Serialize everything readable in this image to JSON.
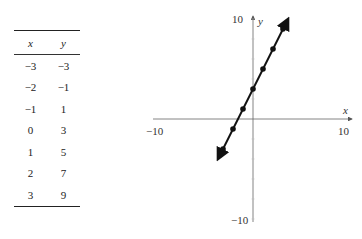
{
  "table": {
    "headers": {
      "x": "x",
      "y": "y"
    },
    "rows": [
      {
        "x": "−3",
        "y": "−3"
      },
      {
        "x": "−2",
        "y": "−1"
      },
      {
        "x": "−1",
        "y": "1"
      },
      {
        "x": "0",
        "y": "3"
      },
      {
        "x": "1",
        "y": "5"
      },
      {
        "x": "2",
        "y": "7"
      },
      {
        "x": "3",
        "y": "9"
      }
    ]
  },
  "graph": {
    "x_axis_label": "x",
    "y_axis_label": "y",
    "x_min_label": "−10",
    "x_max_label": "10",
    "y_min_label": "−10",
    "y_max_label": "10"
  },
  "chart_data": {
    "type": "line",
    "title": "",
    "equation": "y = 2x + 3",
    "x": [
      -3,
      -2,
      -1,
      0,
      1,
      2,
      3
    ],
    "series": [
      {
        "name": "y = 2x + 3",
        "values": [
          -3,
          -1,
          1,
          3,
          5,
          7,
          9
        ]
      }
    ],
    "xlabel": "x",
    "ylabel": "y",
    "xlim": [
      -10,
      10
    ],
    "ylim": [
      -10,
      10
    ],
    "x_tick_labels": [
      "−10",
      "10"
    ],
    "y_tick_labels": [
      "−10",
      "10"
    ],
    "grid": false,
    "legend": null,
    "line_arrows_both_ends": true
  }
}
